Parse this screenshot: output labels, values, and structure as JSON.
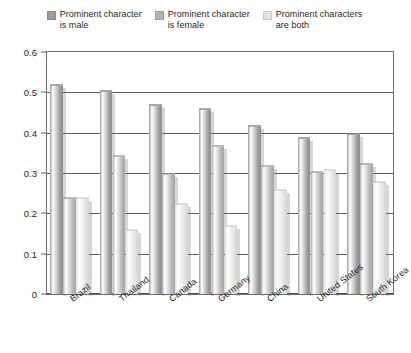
{
  "legend": {
    "position": "top-center",
    "entries": [
      {
        "label": "Prominent character\nis male",
        "color": "#9c9c9c",
        "icon": "legend-swatch-icon"
      },
      {
        "label": "Prominent character\nis female",
        "color": "#b3b3b3",
        "icon": "legend-swatch-icon"
      },
      {
        "label": "Prominent characters\nare both",
        "color": "#e2e2e2",
        "icon": "legend-swatch-icon"
      }
    ]
  },
  "axes": {
    "y_ticks": [
      "0.6",
      "0.5",
      "0.4",
      "0.3",
      "0.2",
      "0.1",
      "0"
    ],
    "y_values": [
      0.6,
      0.5,
      0.4,
      0.3,
      0.2,
      0.1,
      0
    ]
  },
  "chart_data": {
    "type": "bar",
    "title": "",
    "subtitle": "",
    "xlabel": "",
    "ylabel": "",
    "ylim": [
      0,
      0.6
    ],
    "ytick_values": [
      0,
      0.1,
      0.2,
      0.3,
      0.4,
      0.5,
      0.6
    ],
    "ytick_labels": [
      "0",
      "0.1",
      "0.2",
      "0.3",
      "0.4",
      "0.5",
      "0.6"
    ],
    "grid": true,
    "grid_axis": "y",
    "legend_position": "top-center",
    "categories": [
      "Brazil",
      "Thailand",
      "Canada",
      "Germany",
      "China",
      "United States",
      "South Korea"
    ],
    "series": [
      {
        "name": "Prominent character is male",
        "color": "#9c9c9c",
        "values": [
          0.515,
          0.5,
          0.465,
          0.455,
          0.415,
          0.385,
          0.395
        ]
      },
      {
        "name": "Prominent character is female",
        "color": "#b3b3b3",
        "values": [
          0.235,
          0.34,
          0.295,
          0.365,
          0.315,
          0.3,
          0.32
        ]
      },
      {
        "name": "Prominent characters are both",
        "color": "#e2e2e2",
        "values": [
          0.235,
          0.155,
          0.22,
          0.165,
          0.255,
          0.305,
          0.275
        ]
      }
    ]
  }
}
